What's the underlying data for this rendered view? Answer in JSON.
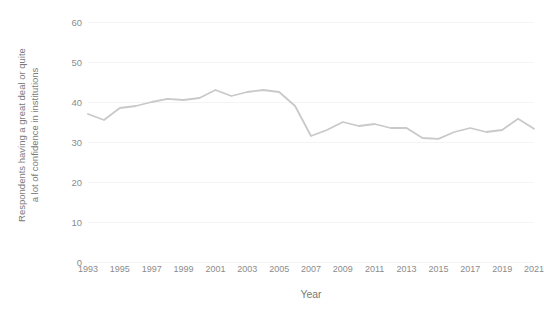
{
  "chart_data": {
    "type": "line",
    "title": "",
    "xlabel": "Year",
    "ylabel": "Respondents having a great deal or quite a lot of confidence in institutions",
    "ylabel_line1": "Respondents having a great deal or quite",
    "ylabel_line2": "a lot of confidence in institutions",
    "xlim": [
      1993,
      2021
    ],
    "ylim": [
      0,
      60
    ],
    "grid": true,
    "legend": "none",
    "line_color": "#c9c9c9",
    "x": [
      1993,
      1994,
      1995,
      1996,
      1997,
      1998,
      1999,
      2000,
      2001,
      2002,
      2003,
      2004,
      2005,
      2006,
      2007,
      2008,
      2009,
      2010,
      2011,
      2012,
      2013,
      2014,
      2015,
      2016,
      2017,
      2018,
      2019,
      2020,
      2021
    ],
    "values": [
      37,
      35.5,
      38.5,
      39,
      40,
      40.8,
      40.5,
      41,
      43,
      41.5,
      42.5,
      43,
      42.5,
      39,
      31.5,
      33,
      35,
      34,
      34.5,
      33.5,
      33.5,
      31,
      30.8,
      32.5,
      33.5,
      32.5,
      33,
      35.8,
      33.3
    ],
    "y_ticks": [
      0,
      10,
      20,
      30,
      40,
      50,
      60
    ],
    "x_ticks": [
      1993,
      1995,
      1997,
      1999,
      2001,
      2003,
      2005,
      2007,
      2009,
      2011,
      2013,
      2015,
      2017,
      2019,
      2021
    ],
    "x_tick_labels": [
      "1993",
      "1995",
      "1997",
      "1999",
      "2001",
      "2003",
      "2005",
      "2007",
      "2009",
      "2011",
      "2013",
      "2015",
      "2017",
      "2019",
      "2021"
    ],
    "y_tick_labels": [
      "0",
      "10",
      "20",
      "30",
      "40",
      "50",
      "60"
    ]
  }
}
